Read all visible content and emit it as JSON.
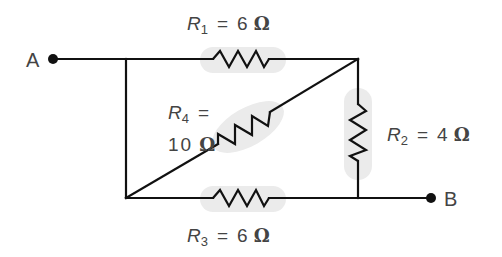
{
  "diagram": {
    "type": "resistor-network",
    "terminals": [
      {
        "id": "A",
        "label": "A"
      },
      {
        "id": "B",
        "label": "B"
      }
    ],
    "resistors": [
      {
        "id": "R1",
        "symbol": "R",
        "subscript": "1",
        "equals": "=",
        "value": "6",
        "unit": "Ω",
        "position": "top"
      },
      {
        "id": "R2",
        "symbol": "R",
        "subscript": "2",
        "equals": "=",
        "value": "4",
        "unit": "Ω",
        "position": "right-vertical"
      },
      {
        "id": "R3",
        "symbol": "R",
        "subscript": "3",
        "equals": "=",
        "value": "6",
        "unit": "Ω",
        "position": "bottom"
      },
      {
        "id": "R4",
        "symbol": "R",
        "subscript": "4",
        "equals": "=",
        "value": "10",
        "unit": "Ω",
        "position": "diagonal"
      }
    ],
    "colors": {
      "wire": "#111111",
      "highlight": "#ebebeb",
      "label_text": "#444444"
    }
  }
}
